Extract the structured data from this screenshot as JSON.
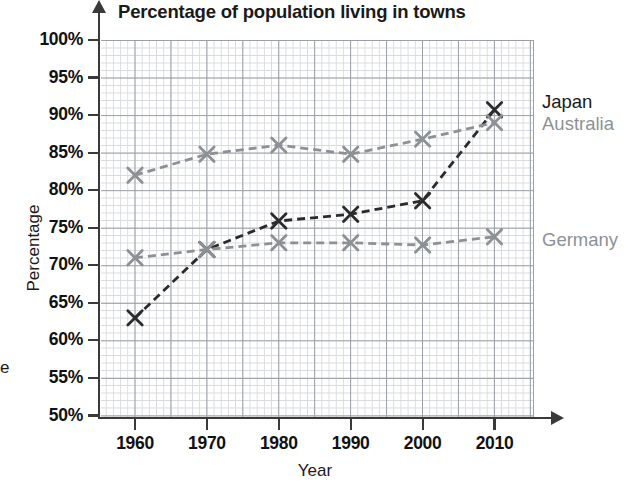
{
  "chart_data": {
    "type": "line",
    "title": "Percentage of population living in towns",
    "xlabel": "Year",
    "ylabel": "Percentage",
    "categories": [
      1960,
      1970,
      1980,
      1990,
      2000,
      2010
    ],
    "x": [
      1960,
      1970,
      1980,
      1990,
      2000,
      2010
    ],
    "xlim": [
      1955,
      2015
    ],
    "ylim": [
      50,
      100
    ],
    "ytick_labels": [
      "100%",
      "95%",
      "90%",
      "85%",
      "80%",
      "75%",
      "70%",
      "65%",
      "60%",
      "55%",
      "50%"
    ],
    "ytick_values": [
      100,
      95,
      90,
      85,
      80,
      75,
      70,
      65,
      60,
      55,
      50
    ],
    "xtick_labels": [
      "1960",
      "1970",
      "1980",
      "1990",
      "2000",
      "2010"
    ],
    "grid": true,
    "grid_minor": true,
    "legend_position": "right-inline",
    "series": [
      {
        "name": "Japan",
        "color": "#2b2b2b",
        "marker": "x",
        "linestyle": "dashed",
        "values": [
          63.0,
          72.1,
          75.9,
          76.8,
          78.6,
          90.7
        ]
      },
      {
        "name": "Australia",
        "color": "#8d9196",
        "marker": "x",
        "linestyle": "dashed",
        "values": [
          82.0,
          84.8,
          86.0,
          84.8,
          86.8,
          89.0
        ]
      },
      {
        "name": "Germany",
        "color": "#8d9196",
        "marker": "x",
        "linestyle": "dashed",
        "values": [
          71.0,
          72.1,
          73.0,
          73.0,
          72.7,
          73.8
        ]
      }
    ]
  },
  "legend": {
    "japan": "Japan",
    "australia": "Australia",
    "germany": "Germany"
  },
  "page_edge_fragment": "e"
}
